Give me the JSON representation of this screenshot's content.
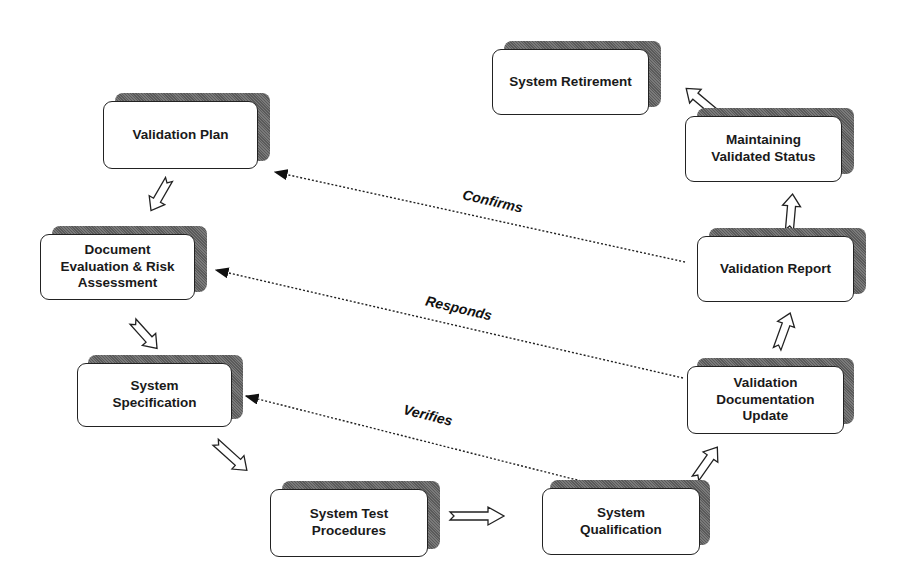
{
  "diagram": {
    "type": "validation-lifecycle-flow",
    "nodes": [
      {
        "id": "validation-plan",
        "label": "Validation Plan"
      },
      {
        "id": "document-evaluation",
        "label": "Document\nEvaluation & Risk\nAssessment"
      },
      {
        "id": "system-specification",
        "label": "System\nSpecification"
      },
      {
        "id": "system-test-procedures",
        "label": "System Test\nProcedures"
      },
      {
        "id": "system-qualification",
        "label": "System\nQualification"
      },
      {
        "id": "validation-documentation-update",
        "label": "Validation\nDocumentation\nUpdate"
      },
      {
        "id": "validation-report",
        "label": "Validation Report"
      },
      {
        "id": "maintaining-validated-status",
        "label": "Maintaining\nValidated Status"
      },
      {
        "id": "system-retirement",
        "label": "System Retirement"
      }
    ],
    "dashed_links": [
      {
        "from": "validation-report",
        "to": "validation-plan",
        "label": "Confirms"
      },
      {
        "from": "validation-documentation-update",
        "to": "document-evaluation",
        "label": "Responds"
      },
      {
        "from": "system-qualification",
        "to": "system-specification",
        "label": "Verifies"
      }
    ]
  }
}
